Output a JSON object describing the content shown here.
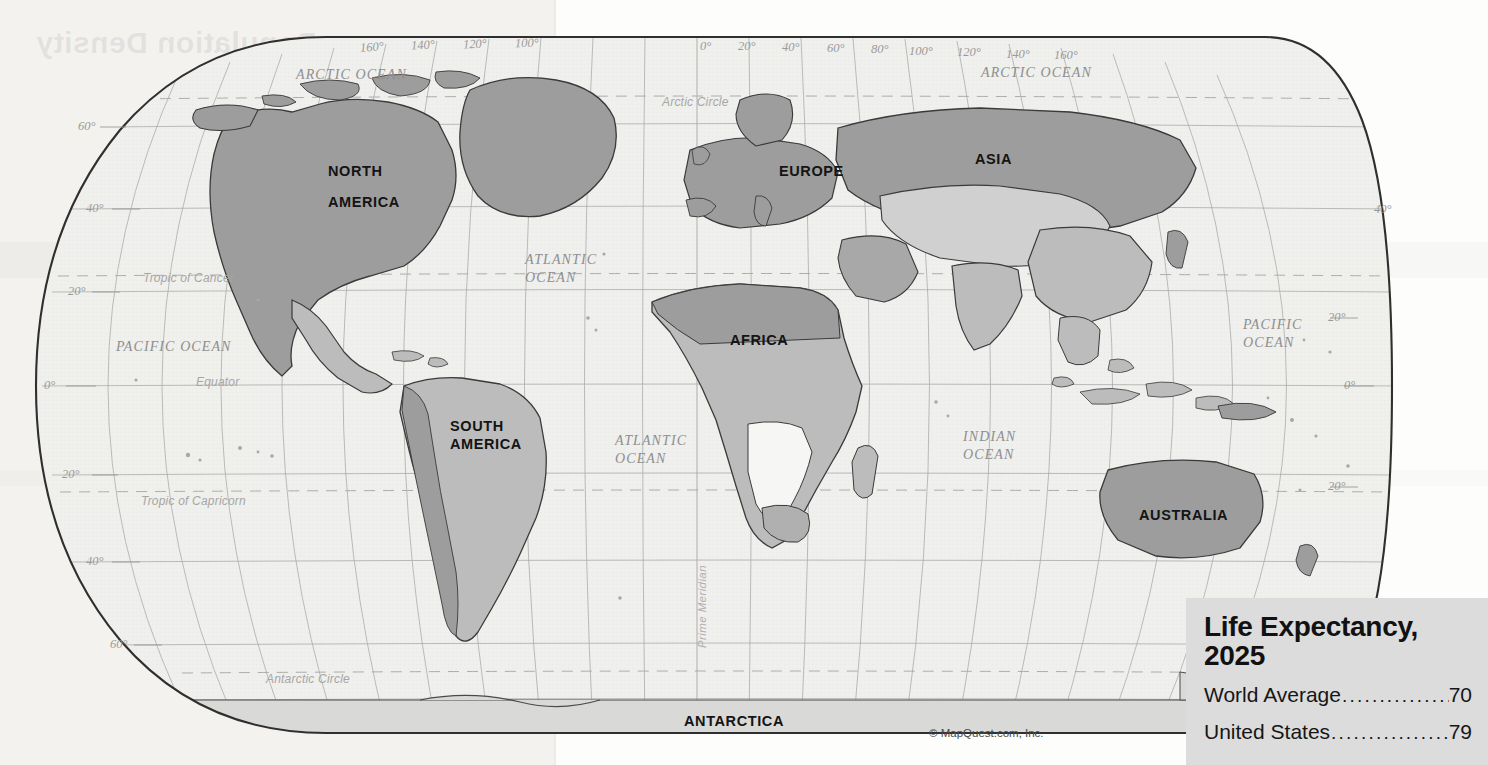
{
  "page": {
    "ghost_title": "Population Density",
    "credit": "© MapQuest.com, Inc."
  },
  "map": {
    "projection": "Robinson",
    "continents": [
      {
        "name": "north-america",
        "label": "NORTH\nAMERICA",
        "line1": "NORTH",
        "line2": "AMERICA",
        "x": 330,
        "y": 163
      },
      {
        "name": "south-america",
        "label": "SOUTH\nAMERICA",
        "line1": "SOUTH",
        "line2": "AMERICA",
        "x": 452,
        "y": 420
      },
      {
        "name": "europe",
        "label": "EUROPE",
        "x": 783,
        "y": 163
      },
      {
        "name": "asia",
        "label": "ASIA",
        "x": 977,
        "y": 152
      },
      {
        "name": "africa",
        "label": "AFRICA",
        "x": 732,
        "y": 333
      },
      {
        "name": "australia",
        "label": "AUSTRALIA",
        "x": 1140,
        "y": 508
      },
      {
        "name": "antarctica",
        "label": "ANTARCTICA",
        "x": 686,
        "y": 715
      }
    ],
    "oceans": [
      {
        "name": "arctic-ocean-west",
        "label": "ARCTIC OCEAN",
        "x": 298,
        "y": 68
      },
      {
        "name": "arctic-ocean-east",
        "label": "ARCTIC OCEAN",
        "x": 983,
        "y": 66
      },
      {
        "name": "pacific-ocean-west",
        "label": "PACIFIC  OCEAN",
        "x": 118,
        "y": 340
      },
      {
        "name": "pacific-ocean-east",
        "label": "PACIFIC\nOCEAN",
        "line1": "PACIFIC",
        "line2": "OCEAN",
        "x": 1245,
        "y": 318
      },
      {
        "name": "atlantic-ocean-north",
        "label": "ATLANTIC\nOCEAN",
        "line1": "ATLANTIC",
        "line2": "OCEAN",
        "x": 527,
        "y": 253
      },
      {
        "name": "atlantic-ocean-south",
        "label": "ATLANTIC\nOCEAN",
        "line1": "ATLANTIC",
        "line2": "OCEAN",
        "x": 617,
        "y": 434
      },
      {
        "name": "indian-ocean",
        "label": "INDIAN\nOCEAN",
        "line1": "INDIAN",
        "line2": "OCEAN",
        "x": 965,
        "y": 430
      }
    ],
    "longitude_labels_west": [
      "160°",
      "140°",
      "120°",
      "100°"
    ],
    "longitude_labels_east": [
      "0°",
      "20°",
      "40°",
      "60°",
      "80°",
      "100°",
      "120°",
      "140°",
      "160°"
    ],
    "longitude_ticks": [
      {
        "label": "160°",
        "x": 372,
        "y": 46
      },
      {
        "label": "140°",
        "x": 423,
        "y": 44
      },
      {
        "label": "120°",
        "x": 475,
        "y": 43
      },
      {
        "label": "100°",
        "x": 527,
        "y": 42
      },
      {
        "label": "0°",
        "x": 707,
        "y": 45
      },
      {
        "label": "20°",
        "x": 748,
        "y": 45
      },
      {
        "label": "40°",
        "x": 790,
        "y": 46
      },
      {
        "label": "60°",
        "x": 835,
        "y": 47
      },
      {
        "label": "80°",
        "x": 880,
        "y": 48
      },
      {
        "label": "100°",
        "x": 920,
        "y": 50
      },
      {
        "label": "120°",
        "x": 965,
        "y": 51
      },
      {
        "label": "140°",
        "x": 1015,
        "y": 52
      },
      {
        "label": "160°",
        "x": 1062,
        "y": 53
      }
    ],
    "latitude_ticks_left": [
      {
        "label": "60°",
        "x": 82,
        "y": 127
      },
      {
        "label": "40°",
        "x": 88,
        "y": 209
      },
      {
        "label": "20°",
        "x": 72,
        "y": 292
      },
      {
        "label": "0°",
        "x": 48,
        "y": 384
      },
      {
        "label": "20°",
        "x": 66,
        "y": 475
      },
      {
        "label": "40°",
        "x": 90,
        "y": 562
      },
      {
        "label": "60°",
        "x": 112,
        "y": 645
      }
    ],
    "latitude_ticks_right": [
      {
        "label": "40°",
        "x": 1378,
        "y": 210
      },
      {
        "label": "20°",
        "x": 1330,
        "y": 318
      },
      {
        "label": "0°",
        "x": 1346,
        "y": 386
      },
      {
        "label": "20°",
        "x": 1330,
        "y": 487
      }
    ],
    "special_lines": [
      {
        "name": "arctic-circle",
        "label": "Arctic Circle",
        "x": 664,
        "y": 101
      },
      {
        "name": "tropic-of-cancer",
        "label": "Tropic of Cancer",
        "x": 145,
        "y": 277
      },
      {
        "name": "equator",
        "label": "Equator",
        "x": 198,
        "y": 381
      },
      {
        "name": "tropic-of-capricorn",
        "label": "Tropic of Capricorn",
        "x": 143,
        "y": 499
      },
      {
        "name": "antarctic-circle",
        "label": "Antarctic Circle",
        "x": 268,
        "y": 678
      },
      {
        "name": "prime-meridian",
        "label": "Prime Meridian",
        "x": 696,
        "y": 648
      }
    ]
  },
  "infobox": {
    "title_line1": "Life Expectancy,",
    "title_line2": "2025",
    "rows": [
      {
        "label": "World Average",
        "value": "70"
      },
      {
        "label": "United States",
        "value": "79"
      }
    ]
  },
  "colors": {
    "paper": "#f3f2ef",
    "ocean": "#efefed",
    "land_dark": "#9d9d9d",
    "land_mid": "#bcbcbc",
    "land_light": "#d8d8d8",
    "land_pale": "#f2f2f0",
    "infobox_bg": "#dcdcdc",
    "graticule": "#a9a9a9",
    "outline": "#333333"
  }
}
